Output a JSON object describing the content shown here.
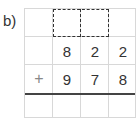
{
  "label": "b)",
  "rows": [
    [
      "",
      "",
      "",
      ""
    ],
    [
      "",
      "8",
      "2",
      "2"
    ],
    [
      "+",
      "9",
      "7",
      "8"
    ],
    [
      "",
      "",
      "",
      ""
    ]
  ]
}
